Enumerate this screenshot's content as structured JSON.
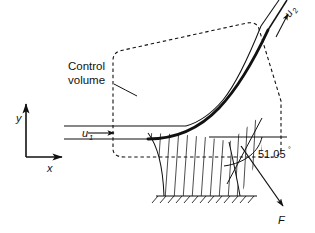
{
  "figure": {
    "background_color": "#ffffff",
    "line_color": "#111111"
  },
  "labels": {
    "control_volume_line1": "Control",
    "control_volume_line2": "volume",
    "inlet_velocity": "u",
    "inlet_velocity_subscript": "1",
    "outlet_velocity": "u",
    "outlet_velocity_subscript": "2",
    "force": "F",
    "axis_x": "x",
    "axis_y": "y",
    "angle_value": "51.05",
    "angle_degree_symbol": "°"
  },
  "geometry": {
    "deflection_angle_degrees": 51.05,
    "jet_inlet_direction": "horizontal-right",
    "jet_outlet_direction": "up-right-inclined",
    "force_direction": "down-right"
  },
  "annotations": {
    "control_volume_style": "dashed-polygon",
    "ground_style": "hatched",
    "support_style": "hatched-pedestal",
    "vane_style": "thick-curve"
  }
}
